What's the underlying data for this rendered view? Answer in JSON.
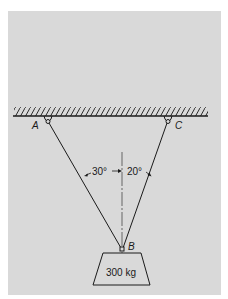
{
  "diagram": {
    "type": "statics-cable-support",
    "background_color": "#d9d9d9",
    "line_color": "#1a1a1a",
    "supports": [
      {
        "label": "A",
        "x": 48,
        "y": 122
      },
      {
        "label": "C",
        "x": 168,
        "y": 122
      }
    ],
    "junction": {
      "label": "B",
      "x": 122,
      "y": 249
    },
    "angles": [
      {
        "label": "30°",
        "side": "left",
        "value_deg": 30
      },
      {
        "label": "20°",
        "side": "right",
        "value_deg": 20
      }
    ],
    "load": {
      "label": "300 kg",
      "mass_kg": 300
    }
  }
}
